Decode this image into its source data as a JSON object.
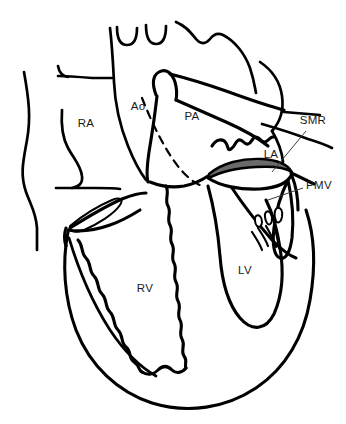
{
  "figure": {
    "background_color": "#ffffff",
    "stroke_color": "#000000",
    "label_color": "#1a1a1a",
    "ring_fill_color": "#6a6a6a",
    "leader_color": "#3c3c3c",
    "width": 346,
    "height": 424
  },
  "labels": [
    {
      "id": "ra",
      "text": "RA",
      "meaning": "right-atrium",
      "x": 86,
      "y": 124
    },
    {
      "id": "ao",
      "text": "Ao",
      "meaning": "aorta",
      "x": 138,
      "y": 107
    },
    {
      "id": "pa",
      "text": "PA",
      "meaning": "pulmonary-artery",
      "x": 192,
      "y": 117
    },
    {
      "id": "smr",
      "text": "SMR",
      "meaning": "septal-mitral-ring",
      "x": 313,
      "y": 121
    },
    {
      "id": "la",
      "text": "LA",
      "meaning": "left-atrium",
      "x": 271,
      "y": 155
    },
    {
      "id": "pmv",
      "text": "PMV",
      "meaning": "posterior-mitral-valve",
      "x": 319,
      "y": 186
    },
    {
      "id": "lv",
      "text": "LV",
      "meaning": "left-ventricle",
      "x": 245,
      "y": 271
    },
    {
      "id": "rv",
      "text": "RV",
      "meaning": "right-ventricle",
      "x": 145,
      "y": 289
    }
  ],
  "structures": [
    {
      "id": "chest-wall",
      "name": "chest-wall-contour"
    },
    {
      "id": "aortic-arch",
      "name": "aortic-arch"
    },
    {
      "id": "arch-branches",
      "name": "brachiocephalic-branches"
    },
    {
      "id": "svc-stub",
      "name": "superior-vena-cava-stub"
    },
    {
      "id": "ra-border",
      "name": "right-atrium-border"
    },
    {
      "id": "pa-trunk",
      "name": "pulmonary-artery-trunk"
    },
    {
      "id": "septum-dashed",
      "name": "interventricular-septum-dashed"
    },
    {
      "id": "pulmonary-veins",
      "name": "pulmonary-veins"
    },
    {
      "id": "la-appendage",
      "name": "left-atrial-appendage-squiggle"
    },
    {
      "id": "mitral-ring",
      "name": "mitral-annulus-shaded-ring"
    },
    {
      "id": "pmv-leaflet",
      "name": "posterior-mitral-valve-leaflet"
    },
    {
      "id": "chordae",
      "name": "chordae-tendineae"
    },
    {
      "id": "tricuspid-leaflet",
      "name": "tricuspid-valve-leaflet"
    },
    {
      "id": "lv-cavity",
      "name": "left-ventricle-cavity"
    },
    {
      "id": "rv-trabeculae",
      "name": "right-ventricle-trabeculations"
    },
    {
      "id": "heart-outline",
      "name": "cardiac-silhouette"
    }
  ]
}
